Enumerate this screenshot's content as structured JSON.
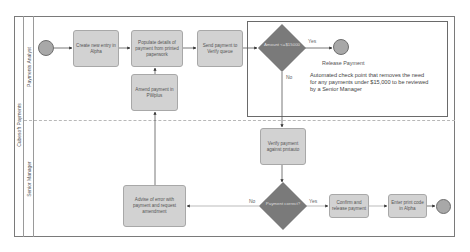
{
  "diagram": {
    "type": "BPMN swimlane process",
    "pool": {
      "label": "Cubesoft Payments"
    },
    "lanes": [
      {
        "id": "analyst",
        "label": "Payments Analyst"
      },
      {
        "id": "manager",
        "label": "Senior Manager"
      }
    ],
    "nodes": {
      "start": {
        "type": "start-event",
        "lane": "analyst"
      },
      "create_entry": {
        "type": "task",
        "lane": "analyst",
        "label": "Create new entry in Alpha"
      },
      "populate_details": {
        "type": "task",
        "lane": "analyst",
        "label": "Populate details of payment from printed paperwork"
      },
      "amend_payment": {
        "type": "task",
        "lane": "analyst",
        "label": "Amend payment in PWplus"
      },
      "send_verify": {
        "type": "task",
        "lane": "analyst",
        "label": "Send payment to Verify queue"
      },
      "check_amount": {
        "type": "gateway",
        "lane": "analyst",
        "label": "Amount <=$15000"
      },
      "release_event": {
        "type": "end-event",
        "lane": "analyst",
        "label": "Release Payment"
      },
      "verify_payment": {
        "type": "task",
        "lane": "manager",
        "label": "Verify payment against pmtauto"
      },
      "payment_correct": {
        "type": "gateway",
        "lane": "manager",
        "label": "Payment correct?"
      },
      "advise_error": {
        "type": "task",
        "lane": "manager",
        "label": "Advise of error with payment and request amendment"
      },
      "confirm_release": {
        "type": "task",
        "lane": "manager",
        "label": "Confirm and release payment"
      },
      "enter_print": {
        "type": "task",
        "lane": "manager",
        "label": "Enter print code in Alpha"
      },
      "end": {
        "type": "end-event",
        "lane": "manager"
      }
    },
    "edges": [
      {
        "from": "start",
        "to": "create_entry",
        "label": ""
      },
      {
        "from": "create_entry",
        "to": "populate_details",
        "label": ""
      },
      {
        "from": "populate_details",
        "to": "send_verify",
        "label": ""
      },
      {
        "from": "send_verify",
        "to": "check_amount",
        "label": ""
      },
      {
        "from": "check_amount",
        "to": "release_event",
        "label": "Yes"
      },
      {
        "from": "check_amount",
        "to": "verify_payment",
        "label": "No"
      },
      {
        "from": "verify_payment",
        "to": "payment_correct",
        "label": ""
      },
      {
        "from": "payment_correct",
        "to": "advise_error",
        "label": "No"
      },
      {
        "from": "payment_correct",
        "to": "confirm_release",
        "label": "Yes"
      },
      {
        "from": "advise_error",
        "to": "amend_payment",
        "label": ""
      },
      {
        "from": "amend_payment",
        "to": "populate_details",
        "label": ""
      },
      {
        "from": "confirm_release",
        "to": "enter_print",
        "label": ""
      },
      {
        "from": "enter_print",
        "to": "end",
        "label": ""
      }
    ],
    "edge_labels": {
      "yes": "Yes",
      "no": "No"
    },
    "annotation": {
      "text": "Automated check point that removes the need for any payments under $15,000  to be reviewed by a Senior Manager"
    },
    "colors": {
      "task_fill": "#d2d2d2",
      "gateway_fill": "#7a7a7a",
      "event_fill": "#a8a8a8",
      "line": "#555555"
    }
  }
}
